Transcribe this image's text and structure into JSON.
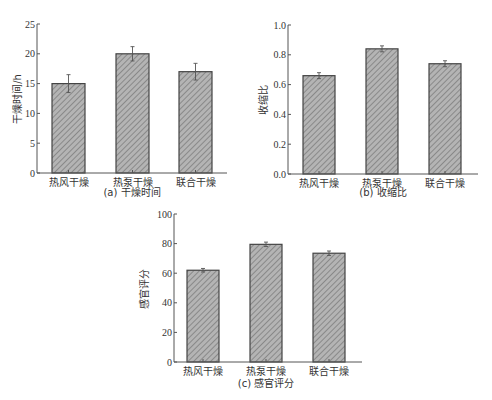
{
  "chart_data": [
    {
      "id": "a",
      "type": "bar",
      "title": "(a) 干燥时间",
      "xlabel": "",
      "ylabel": "干燥时间/h",
      "categories": [
        "热风干燥",
        "热泵干燥",
        "联合干燥"
      ],
      "values": [
        15,
        20,
        17
      ],
      "errors": [
        1.5,
        1.2,
        1.4
      ],
      "ylim": [
        0,
        25
      ],
      "yticks": [
        0,
        5,
        10,
        15,
        20,
        25
      ],
      "ytick_labels": [
        "0",
        "5",
        "10",
        "15",
        "20",
        "25"
      ],
      "grid": false,
      "bar_style": "gray hatched with dark outline"
    },
    {
      "id": "b",
      "type": "bar",
      "title": "(b) 收缩比",
      "xlabel": "",
      "ylabel": "收缩比",
      "categories": [
        "热风干燥",
        "热泵干燥",
        "联合干燥"
      ],
      "values": [
        0.66,
        0.84,
        0.74
      ],
      "errors": [
        0.02,
        0.02,
        0.02
      ],
      "ylim": [
        0,
        1.0
      ],
      "yticks": [
        0,
        0.2,
        0.4,
        0.6,
        0.8,
        1.0
      ],
      "ytick_labels": [
        "0.0",
        "0.2",
        "0.4",
        "0.6",
        "0.8",
        "1.0"
      ],
      "grid": false,
      "bar_style": "gray hatched with dark outline"
    },
    {
      "id": "c",
      "type": "bar",
      "title": "(c) 感官评分",
      "xlabel": "",
      "ylabel": "感官评分",
      "categories": [
        "热风干燥",
        "热泵干燥",
        "联合干燥"
      ],
      "values": [
        62,
        79.5,
        73.5
      ],
      "errors": [
        1.2,
        1.5,
        1.5
      ],
      "ylim": [
        0,
        100
      ],
      "yticks": [
        0,
        20,
        40,
        60,
        80,
        100
      ],
      "ytick_labels": [
        "0",
        "20",
        "40",
        "60",
        "80",
        "100"
      ],
      "grid": false,
      "bar_style": "gray hatched with dark outline"
    }
  ],
  "colors": {
    "bar_fill": "#a8a8a8",
    "bar_hatch": "#7a7a7a",
    "bar_outline": "#444444",
    "axis": "#555555",
    "text": "#333333"
  }
}
